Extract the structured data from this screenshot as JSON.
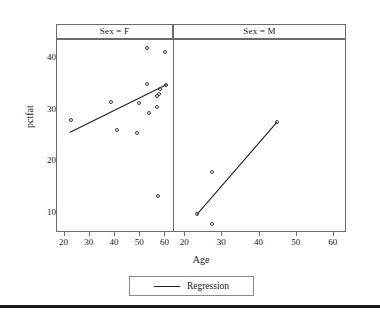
{
  "axes": {
    "x_title": "Age",
    "y_title": "pctfat",
    "x_ticks": [
      20,
      30,
      40,
      50,
      60
    ],
    "y_ticks": [
      10,
      20,
      30,
      40
    ],
    "xlim": [
      17,
      63
    ],
    "ylim": [
      6.5,
      43.5
    ]
  },
  "panels": [
    {
      "strip_label": "Sex = F"
    },
    {
      "strip_label": "Sex = M"
    }
  ],
  "legend": {
    "label": "Regression",
    "swatch": "line-swatch"
  },
  "chart_data": {
    "type": "scatter",
    "title": "",
    "xlabel": "Age",
    "ylabel": "pctfat",
    "xlim": [
      17,
      63
    ],
    "ylim": [
      6.5,
      43.5
    ],
    "xticks": [
      20,
      30,
      40,
      50,
      60
    ],
    "yticks": [
      10,
      20,
      30,
      40
    ],
    "grid": false,
    "legend": {
      "position": "bottom",
      "entries": [
        "Regression"
      ]
    },
    "facet_variable": "Sex",
    "panels": [
      {
        "label": "Sex = F",
        "points": [
          {
            "x": 22.7,
            "y": 28.0
          },
          {
            "x": 38.6,
            "y": 31.4
          },
          {
            "x": 40.6,
            "y": 26.0
          },
          {
            "x": 48.9,
            "y": 25.4
          },
          {
            "x": 49.6,
            "y": 31.2
          },
          {
            "x": 52.5,
            "y": 42.0
          },
          {
            "x": 52.6,
            "y": 35.0
          },
          {
            "x": 53.5,
            "y": 29.4
          },
          {
            "x": 56.5,
            "y": 32.6
          },
          {
            "x": 56.8,
            "y": 30.5
          },
          {
            "x": 57.2,
            "y": 13.2
          },
          {
            "x": 57.6,
            "y": 33.1
          },
          {
            "x": 58.0,
            "y": 34.0
          },
          {
            "x": 59.8,
            "y": 41.2
          },
          {
            "x": 60.2,
            "y": 34.8
          }
        ],
        "regression_line": {
          "x1": 22.0,
          "y1": 25.6,
          "x2": 60.5,
          "y2": 34.9
        }
      },
      {
        "label": "Sex = M",
        "points": [
          {
            "x": 23.2,
            "y": 9.7
          },
          {
            "x": 27.1,
            "y": 18.0
          },
          {
            "x": 27.3,
            "y": 7.9
          },
          {
            "x": 44.7,
            "y": 27.6
          }
        ],
        "regression_line": {
          "x1": 23.2,
          "y1": 9.7,
          "x2": 44.7,
          "y2": 27.6
        }
      }
    ]
  }
}
